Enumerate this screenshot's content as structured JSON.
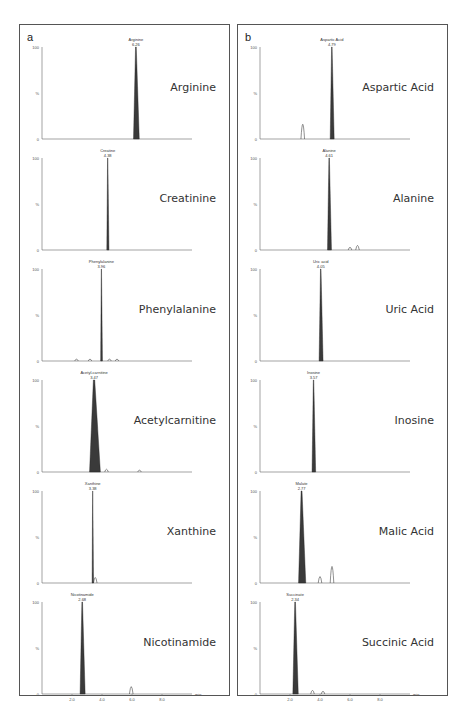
{
  "panels": [
    {
      "letter": "a"
    },
    {
      "letter": "b"
    }
  ],
  "axis": {
    "y_top": "100",
    "y_mid": "%",
    "y_bottom": "0",
    "x_ticks": [
      "2.0",
      "4.0",
      "6.0",
      "8.0"
    ],
    "x_unit": "min"
  },
  "caption": "",
  "chart_data": [
    {
      "type": "line",
      "panel": "a",
      "xlabel": "min",
      "ylabel": "%",
      "xlim": [
        0,
        10
      ],
      "ylim": [
        0,
        100
      ],
      "x_ticks": [
        2.0,
        4.0,
        6.0,
        8.0
      ],
      "traces": [
        {
          "compound": "Arginine",
          "peak_label": "Arginine",
          "rt": "6.26",
          "rt_value": 6.26,
          "peak_width": 0.32,
          "minor_peaks": []
        },
        {
          "compound": "Creatinine",
          "peak_label": "Creatine",
          "rt": "4.38",
          "rt_value": 4.38,
          "peak_width": 0.12,
          "minor_peaks": []
        },
        {
          "compound": "Phenylalanine",
          "peak_label": "Phenylalanine",
          "rt": "3.96",
          "rt_value": 3.96,
          "peak_width": 0.1,
          "minor_peaks": [
            {
              "x": 2.3,
              "h": 2
            },
            {
              "x": 3.2,
              "h": 2
            },
            {
              "x": 4.5,
              "h": 2
            },
            {
              "x": 5.0,
              "h": 2
            }
          ]
        },
        {
          "compound": "Acetylcarnitine",
          "peak_label": "Acetyl-carnitine",
          "rt": "3.47",
          "rt_value": 3.47,
          "peak_width": 0.6,
          "minor_peaks": [
            {
              "x": 4.3,
              "h": 3
            },
            {
              "x": 6.5,
              "h": 2
            }
          ]
        },
        {
          "compound": "Xanthine",
          "peak_label": "Xanthine",
          "rt": "3.38",
          "rt_value": 3.38,
          "peak_width": 0.08,
          "minor_peaks": [
            {
              "x": 3.55,
              "h": 6
            }
          ]
        },
        {
          "compound": "Nicotinamide",
          "peak_label": "Nicotinamide",
          "rt": "2.68",
          "rt_value": 2.68,
          "peak_width": 0.28,
          "minor_peaks": [
            {
              "x": 5.95,
              "h": 8
            }
          ]
        }
      ]
    },
    {
      "type": "line",
      "panel": "b",
      "xlabel": "min",
      "ylabel": "%",
      "xlim": [
        0,
        10
      ],
      "ylim": [
        0,
        100
      ],
      "x_ticks": [
        2.0,
        4.0,
        6.0,
        8.0
      ],
      "traces": [
        {
          "compound": "Aspartic Acid",
          "peak_label": "Aspartic Acid",
          "rt": "4.79",
          "rt_value": 4.79,
          "peak_width": 0.22,
          "minor_peaks": [
            {
              "x": 2.85,
              "h": 16
            }
          ]
        },
        {
          "compound": "Alanine",
          "peak_label": "Alanine",
          "rt": "4.61",
          "rt_value": 4.61,
          "peak_width": 0.22,
          "minor_peaks": [
            {
              "x": 6.0,
              "h": 3
            },
            {
              "x": 6.5,
              "h": 5
            }
          ]
        },
        {
          "compound": "Uric Acid",
          "peak_label": "Uric acid",
          "rt": "4.05",
          "rt_value": 4.05,
          "peak_width": 0.22,
          "minor_peaks": []
        },
        {
          "compound": "Inosine",
          "peak_label": "Inosine",
          "rt": "3.57",
          "rt_value": 3.57,
          "peak_width": 0.2,
          "minor_peaks": []
        },
        {
          "compound": "Malic Acid",
          "peak_label": "Malate",
          "rt": "2.77",
          "rt_value": 2.77,
          "peak_width": 0.4,
          "minor_peaks": [
            {
              "x": 4.0,
              "h": 7
            },
            {
              "x": 4.8,
              "h": 18
            }
          ]
        },
        {
          "compound": "Succinic Acid",
          "peak_label": "Succinate",
          "rt": "2.34",
          "rt_value": 2.34,
          "peak_width": 0.3,
          "minor_peaks": [
            {
              "x": 3.5,
              "h": 4
            },
            {
              "x": 4.2,
              "h": 3
            }
          ]
        }
      ]
    }
  ]
}
